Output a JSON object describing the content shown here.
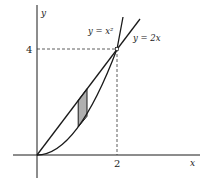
{
  "figure": {
    "axes": {
      "x_label": "x",
      "y_label": "y",
      "x_tick": "2",
      "y_tick": "4"
    },
    "curves": [
      {
        "name": "parabola",
        "label": "y = x²",
        "equation": "y = x^2"
      },
      {
        "name": "line",
        "label": "y = 2x",
        "equation": "y = 2x"
      }
    ],
    "intersection": {
      "x": 2,
      "y": 4
    },
    "shaded_strip": {
      "x_from": 1.03,
      "x_to": 1.25,
      "fill": "#b0b0b0"
    },
    "colors": {
      "stroke": "#1a1a1a",
      "dashed": "#333333"
    }
  }
}
